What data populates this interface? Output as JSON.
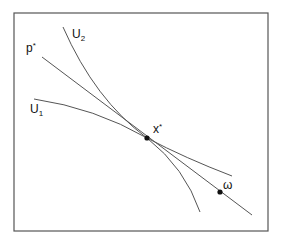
{
  "diagram": {
    "type": "economics-indifference-diagram",
    "curves": [
      {
        "id": "U1",
        "label": "U",
        "subscript": "1",
        "kind": "indifference-curve"
      },
      {
        "id": "U2",
        "label": "U",
        "subscript": "2",
        "kind": "indifference-curve"
      },
      {
        "id": "p_star",
        "label": "p",
        "superscript": "*",
        "kind": "price-line"
      }
    ],
    "points": [
      {
        "id": "x_star",
        "label": "x",
        "superscript": "*",
        "kind": "equilibrium-allocation"
      },
      {
        "id": "omega",
        "label": "ω",
        "kind": "endowment"
      }
    ],
    "colors": {
      "stroke": "#555555",
      "point": "#111111",
      "background": "#ffffff"
    }
  }
}
